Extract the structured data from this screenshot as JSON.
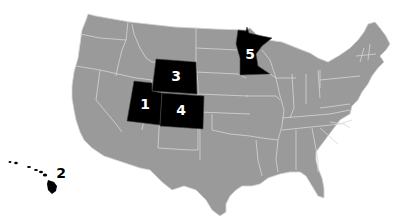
{
  "map": {
    "title": "",
    "base_color": "#9a9a9a",
    "border_color": "#d6d6d6",
    "highlight_color": "#000000",
    "label_color": "#ffffff",
    "highlighted_states": [
      {
        "rank": "1",
        "state": "Utah"
      },
      {
        "rank": "2",
        "state": "Hawaii"
      },
      {
        "rank": "3",
        "state": "Wyoming"
      },
      {
        "rank": "4",
        "state": "Colorado"
      },
      {
        "rank": "5",
        "state": "Minnesota"
      }
    ],
    "labels": {
      "utah": "1",
      "hawaii": "2",
      "wyoming": "3",
      "colorado": "4",
      "minnesota": "5"
    }
  }
}
